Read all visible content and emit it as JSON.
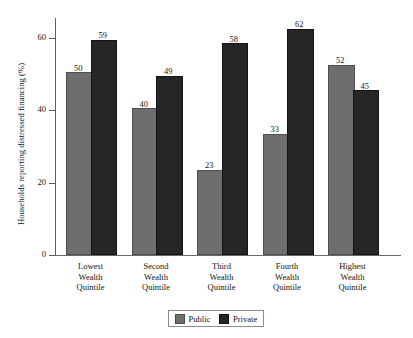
{
  "chart_data": {
    "type": "bar",
    "title": "",
    "subtitle": "",
    "xlabel": "",
    "ylabel": "Households reporting distressed financing (%)",
    "categories": [
      "Lowest Wealth Quintile",
      "Second Wealth Quintile",
      "Third Wealth Quintile",
      "Fourth Wealth Quintile",
      "Highest Wealth Quintile"
    ],
    "category_lines": [
      [
        "Lowest",
        "Wealth",
        "Quintile"
      ],
      [
        "Second",
        "Wealth",
        "Quintile"
      ],
      [
        "Third",
        "Wealth",
        "Quintile"
      ],
      [
        "Fourth",
        "Wealth",
        "Quintile"
      ],
      [
        "Highest",
        "Wealth",
        "Quintile"
      ]
    ],
    "series": [
      {
        "name": "Public",
        "color": "#6e6e6e",
        "values": [
          50,
          40,
          23,
          33,
          52
        ]
      },
      {
        "name": "Private",
        "color": "#262626",
        "values": [
          59,
          49,
          58,
          62,
          45
        ]
      }
    ],
    "ylim": [
      0,
      68
    ],
    "yticks": [
      0,
      20,
      40,
      60
    ],
    "ytick_labels": [
      "0",
      "20",
      "40",
      "60"
    ],
    "grid": false,
    "legend_position": "bottom-center",
    "data_labels": true
  },
  "legend": {
    "entries": [
      {
        "label": "Public"
      },
      {
        "label": "Private"
      }
    ]
  }
}
